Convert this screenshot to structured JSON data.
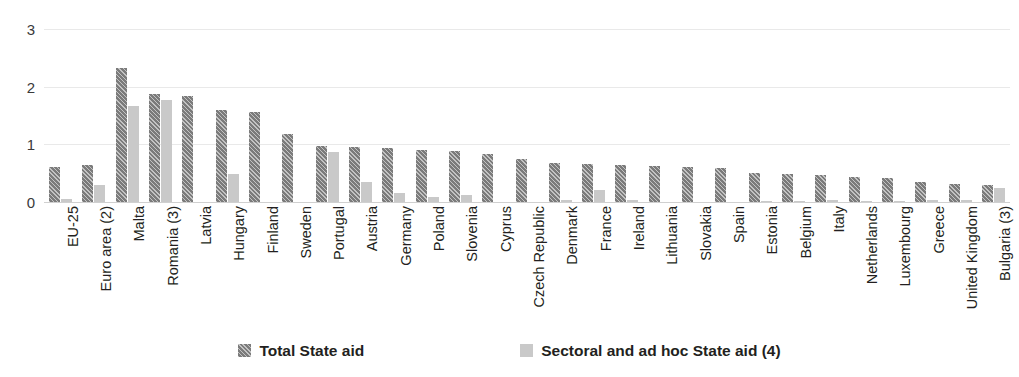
{
  "chart_data": {
    "type": "bar",
    "title": "",
    "xlabel": "",
    "ylabel": "",
    "ylim": [
      0,
      3
    ],
    "yticks": [
      0,
      1,
      2,
      3
    ],
    "grid": true,
    "legend_position": "bottom",
    "colors": {
      "total": "#7b7b7b",
      "sectoral": "#c9c9c9",
      "gridline": "#e9e9e9",
      "text": "#231f20"
    },
    "categories": [
      "EU-25",
      "Euro area (2)",
      "Malta",
      "Romania (3)",
      "Latvia",
      "Hungary",
      "Finland",
      "Sweden",
      "Portugal",
      "Austria",
      "Germany",
      "Poland",
      "Slovenia",
      "Cyprus",
      "Czech Republic",
      "Denmark",
      "France",
      "Ireland",
      "Lithuania",
      "Slovakia",
      "Spain",
      "Estonia",
      "Belgium",
      "Italy",
      "Netherlands",
      "Luxembourg",
      "Greece",
      "United Kingdom",
      "Bulgaria (3)"
    ],
    "series": [
      {
        "name": "Total State aid",
        "values": [
          0.6,
          0.64,
          2.33,
          1.87,
          1.83,
          1.6,
          1.56,
          1.18,
          0.97,
          0.95,
          0.93,
          0.91,
          0.89,
          0.83,
          0.74,
          0.67,
          0.66,
          0.65,
          0.63,
          0.61,
          0.59,
          0.51,
          0.48,
          0.46,
          0.44,
          0.41,
          0.35,
          0.32,
          0.3
        ]
      },
      {
        "name": "Sectoral and ad hoc State aid (4)",
        "values": [
          0.05,
          0.29,
          1.67,
          1.77,
          0.0,
          0.48,
          0.0,
          0.0,
          0.86,
          0.35,
          0.16,
          0.08,
          0.12,
          0.0,
          0.0,
          0.04,
          0.2,
          0.03,
          0.0,
          0.0,
          0.0,
          0.02,
          0.02,
          0.03,
          0.02,
          0.02,
          0.04,
          0.03,
          0.25
        ]
      }
    ]
  },
  "legend": {
    "items": [
      {
        "label": "Total State aid",
        "swatch": "total-aid-swatch"
      },
      {
        "label": "Sectoral and ad hoc State aid (4)",
        "swatch": "sectoral-aid-swatch"
      }
    ]
  }
}
